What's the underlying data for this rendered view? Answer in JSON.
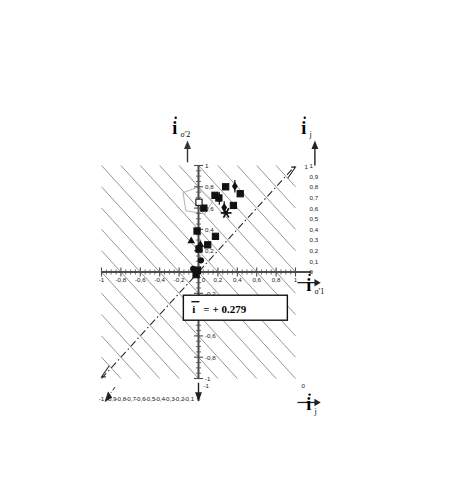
{
  "figure": {
    "background": "#ffffff",
    "axis_color": "#4d4d4d",
    "grid_color": "#6e6e6e",
    "marker_color": "#111111",
    "polygon_color": "#b9b9b9",
    "dashdot_color": "#2b2b2b"
  },
  "labels": {
    "y_axis_symbol": "i",
    "y_axis_subscript": "σ'2",
    "x_axis_symbol": "i",
    "x_axis_subscript": "σ'1",
    "top_right_symbol": "i",
    "top_right_subscript": "j",
    "bottom_right_symbol": "i",
    "bottom_right_subscript": "j",
    "mean_label": "i",
    "mean_equation": "= + 0.279",
    "mean_text": "i = +0.279"
  },
  "chart_data": {
    "type": "scatter",
    "title": "",
    "xlabel": "iσ'1",
    "ylabel": "iσ'2",
    "xlim": [
      -1,
      1
    ],
    "ylim": [
      -1,
      1
    ],
    "grid": true,
    "legend_position": "none",
    "xticks": [
      "-1",
      "-0,8",
      "-0,6",
      "-0,4",
      "-0,2",
      "0",
      "0,2",
      "0,4",
      "0,6",
      "0,8",
      "1"
    ],
    "xtick_values": [
      -1,
      -0.8,
      -0.6,
      -0.4,
      -0.2,
      0,
      0.2,
      0.4,
      0.6,
      0.8,
      1
    ],
    "yticks": [
      "-1",
      "-0,8",
      "-0,6",
      "-0,4",
      "-0,2",
      "0",
      "0,2",
      "0,4",
      "0,6",
      "0,8",
      "1"
    ],
    "ytick_values": [
      -1,
      -0.8,
      -0.6,
      -0.4,
      -0.2,
      0,
      0.2,
      0.4,
      0.6,
      0.8,
      1
    ],
    "right_axis_ticks": [
      "1",
      "0,9",
      "0,8",
      "0,7",
      "0,6",
      "0,5",
      "0,4",
      "0,3",
      "0,2",
      "0,1",
      "0"
    ],
    "right_axis_values": [
      1,
      0.9,
      0.8,
      0.7,
      0.6,
      0.5,
      0.4,
      0.3,
      0.2,
      0.1,
      0
    ],
    "bottom_axis_ticks": [
      "-1",
      "-0,9",
      "-0,8",
      "-0,7",
      "-0,6",
      "-0,5",
      "-0,4",
      "-0,3",
      "-0,2",
      "-0,1",
      "0"
    ],
    "bottom_axis_values": [
      -1,
      -0.9,
      -0.8,
      -0.7,
      -0.6,
      -0.5,
      -0.4,
      -0.3,
      -0.2,
      -0.1,
      0
    ],
    "grid_note": "iso-ij diagonal gridlines of slope -1 spanning the square, spaced 0.2 in ij",
    "diagonal_gridline_offsets": [
      -1.0,
      -0.8,
      -0.6,
      -0.4,
      -0.2,
      0.0,
      0.2,
      0.4,
      0.6,
      0.8,
      1.0
    ],
    "identity_line": {
      "label": "dash-dot 1:1 line",
      "from": [
        -1,
        -1
      ],
      "to": [
        1,
        1
      ]
    },
    "mean_value": 0.279,
    "series": [
      {
        "name": "filled-square",
        "marker": "square",
        "fill": "solid",
        "points": [
          [
            0.28,
            0.8
          ],
          [
            0.17,
            0.72
          ],
          [
            0.21,
            0.695
          ],
          [
            0.43,
            0.735
          ],
          [
            0.36,
            0.625
          ],
          [
            0.055,
            0.6
          ],
          [
            -0.015,
            0.385
          ],
          [
            0.095,
            0.255
          ],
          [
            0.175,
            0.335
          ],
          [
            0.005,
            0.215
          ],
          [
            -0.01,
            0.015
          ],
          [
            -0.025,
            -0.025
          ]
        ]
      },
      {
        "name": "open-square",
        "marker": "square",
        "fill": "open",
        "points": [
          [
            0.005,
            0.655
          ]
        ]
      },
      {
        "name": "filled-triangle",
        "marker": "triangle",
        "fill": "solid",
        "points": [
          [
            -0.075,
            0.295
          ],
          [
            0.02,
            0.26
          ]
        ]
      },
      {
        "name": "filled-circle",
        "marker": "circle",
        "fill": "solid",
        "points": [
          [
            0.025,
            0.11
          ],
          [
            -0.055,
            0.03
          ]
        ]
      },
      {
        "name": "diamond-with-bar",
        "marker": "diamond",
        "fill": "solid",
        "points": [
          [
            0.375,
            0.805
          ],
          [
            0.215,
            0.69
          ],
          [
            0.265,
            0.605
          ]
        ]
      },
      {
        "name": "asterisk",
        "marker": "asterisk",
        "fill": "solid",
        "points": [
          [
            0.285,
            0.555
          ]
        ]
      }
    ],
    "annotations": [
      {
        "text": "i = +0.279",
        "x": 0.38,
        "y": -0.34,
        "boxed": true
      },
      {
        "text": "polygon outline (light gray)",
        "x": 0.0,
        "y": 0.67,
        "boxed": false
      }
    ],
    "polygon_outline": [
      [
        -0.16,
        0.745
      ],
      [
        -0.01,
        0.795
      ],
      [
        0.145,
        0.665
      ],
      [
        0.065,
        0.545
      ],
      [
        -0.13,
        0.575
      ]
    ]
  }
}
